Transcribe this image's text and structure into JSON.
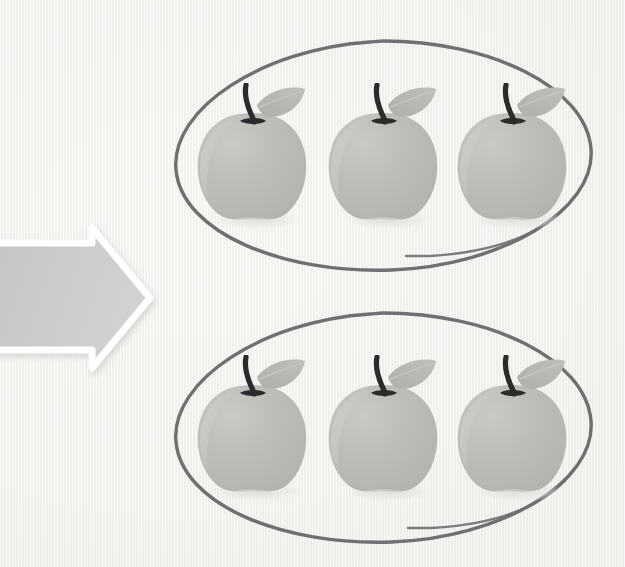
{
  "illustration": {
    "title": "Equal groups of apples",
    "description": "An arrow pointing right toward two hand-drawn circles, each containing three apples",
    "background_color": "#f4f4f2"
  },
  "arrow": {
    "name": "right-arrow",
    "direction": "right",
    "fill_color": "#c9c9c7",
    "outline_color": "#ffffff",
    "shadow_color": "#d8d8d5"
  },
  "groups": [
    {
      "id": "group-1",
      "label": "first group of apples",
      "ellipse": {
        "stroke_color": "#6f6f6f",
        "stroke_width": 3.4,
        "center_x": 383,
        "center_y": 156,
        "radius_x": 208,
        "radius_y": 116
      },
      "apple_count": 3,
      "apples": [
        {
          "id": "apple-1-1",
          "cx": 252,
          "cy": 158
        },
        {
          "id": "apple-1-2",
          "cx": 383,
          "cy": 158
        },
        {
          "id": "apple-1-3",
          "cx": 512,
          "cy": 158
        }
      ]
    },
    {
      "id": "group-2",
      "label": "second group of apples",
      "ellipse": {
        "stroke_color": "#6f6f6f",
        "stroke_width": 3.4,
        "center_x": 383,
        "center_y": 428,
        "radius_x": 208,
        "radius_y": 116
      },
      "apple_count": 3,
      "apples": [
        {
          "id": "apple-2-1",
          "cx": 252,
          "cy": 430
        },
        {
          "id": "apple-2-2",
          "cx": 383,
          "cy": 430
        },
        {
          "id": "apple-2-3",
          "cx": 512,
          "cy": 430
        }
      ]
    }
  ],
  "apple_style": {
    "body_color": "#b9bbb6",
    "body_highlight_color": "#c6c8c3",
    "body_shade_color": "#b0b2ad",
    "stem_color": "#2b2b2b",
    "leaf_color": "#b4b6b1",
    "leaf_vein_color": "#c2c4bf",
    "shadow_color": "#e2e2df"
  },
  "totals": {
    "groups": 2,
    "apples_per_group": 3,
    "total_apples": 6
  }
}
